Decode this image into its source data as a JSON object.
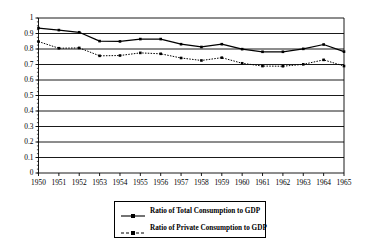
{
  "chart_data": {
    "type": "line",
    "title": "",
    "xlabel": "",
    "ylabel": "",
    "categories": [
      "1950",
      "1951",
      "1952",
      "1953",
      "1954",
      "1955",
      "1956",
      "1957",
      "1958",
      "1959",
      "1960",
      "1961",
      "1962",
      "1963",
      "1964",
      "1965"
    ],
    "xtick_labels": [
      "1950",
      "1951",
      "1952",
      "1953",
      "1954",
      "1955",
      "1956",
      "1957",
      "1958",
      "1959",
      "1960",
      "1961",
      "1962",
      "1963",
      "1964",
      "1965"
    ],
    "ytick_labels": [
      "0",
      "0.1",
      "0.2",
      "0.3",
      "0.4",
      "0.5",
      "0.6",
      "0.7",
      "0.8",
      "0.9",
      "1"
    ],
    "ytick_values": [
      0,
      0.1,
      0.2,
      0.3,
      0.4,
      0.5,
      0.6,
      0.7,
      0.8,
      0.9,
      1
    ],
    "ylim": [
      0,
      1
    ],
    "grid": "horizontal",
    "legend_position": "bottom-center",
    "series": [
      {
        "name": "Ratio of Total Consumption to GDP",
        "line_style": "solid",
        "marker": "square",
        "color": "#000000",
        "values": [
          0.935,
          0.922,
          0.908,
          0.851,
          0.849,
          0.864,
          0.864,
          0.831,
          0.813,
          0.831,
          0.799,
          0.782,
          0.782,
          0.801,
          0.829,
          0.783
        ]
      },
      {
        "name": "Ratio of Private Consumption to GDP",
        "line_style": "dotted",
        "marker": "square",
        "color": "#000000",
        "values": [
          0.848,
          0.805,
          0.807,
          0.756,
          0.758,
          0.775,
          0.769,
          0.742,
          0.726,
          0.744,
          0.708,
          0.69,
          0.689,
          0.701,
          0.73,
          0.69
        ]
      }
    ]
  },
  "legend": {
    "entries": [
      {
        "label": "Ratio of Total Consumption to GDP"
      },
      {
        "label": "Ratio of Private Consumption to GDP"
      }
    ]
  }
}
